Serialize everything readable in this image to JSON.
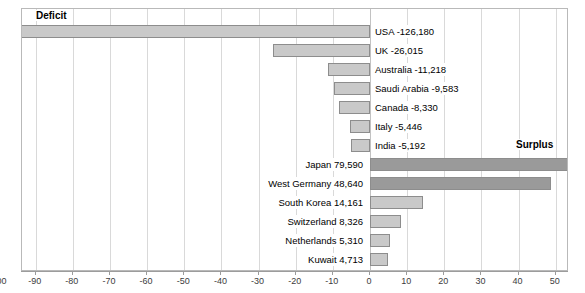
{
  "chart_data": {
    "type": "bar",
    "orientation": "horizontal",
    "title": "",
    "xlabel": "",
    "ylabel": "",
    "xlim": [
      -135,
      78
    ],
    "grid": true,
    "grid_step": 10,
    "unit_note": "values in millions",
    "annotations": [
      {
        "text": "Deficit",
        "position": "top-left"
      },
      {
        "text": "Surplus",
        "position": "middle-right"
      }
    ],
    "xticks": [
      -130,
      -120,
      -110,
      -100,
      -90,
      -80,
      -70,
      -60,
      -50,
      -40,
      -30,
      -20,
      -10,
      0,
      10,
      20,
      30,
      40,
      50,
      60,
      70
    ],
    "xtick_labels": [
      "-130",
      "-120",
      "-110",
      "-100",
      "-90",
      "-80",
      "-70",
      "-60",
      "-50",
      "-40",
      "-30",
      "-20",
      "-10",
      "0",
      "10",
      "20",
      "30",
      "40",
      "50",
      "60",
      "70"
    ],
    "categories": [
      "USA",
      "UK",
      "Australia",
      "Saudi Arabia",
      "Canada",
      "Italy",
      "India",
      "Japan",
      "West Germany",
      "South Korea",
      "Switzerland",
      "Netherlands",
      "Kuwait"
    ],
    "values": [
      -126.18,
      -26.015,
      -11.218,
      -9.583,
      -8.33,
      -5.446,
      -5.192,
      79.59,
      48.64,
      14.161,
      8.326,
      5.31,
      4.713
    ],
    "bars": [
      {
        "label": "USA -126,180",
        "name": "USA",
        "value": -126.18,
        "side": "deficit",
        "shade": "light"
      },
      {
        "label": "UK -26,015",
        "name": "UK",
        "value": -26.015,
        "side": "deficit",
        "shade": "light"
      },
      {
        "label": "Australia -11,218",
        "name": "Australia",
        "value": -11.218,
        "side": "deficit",
        "shade": "light"
      },
      {
        "label": "Saudi Arabia -9,583",
        "name": "Saudi Arabia",
        "value": -9.583,
        "side": "deficit",
        "shade": "light"
      },
      {
        "label": "Canada -8,330",
        "name": "Canada",
        "value": -8.33,
        "side": "deficit",
        "shade": "light"
      },
      {
        "label": "Italy -5,446",
        "name": "Italy",
        "value": -5.446,
        "side": "deficit",
        "shade": "light"
      },
      {
        "label": "India -5,192",
        "name": "India",
        "value": -5.192,
        "side": "deficit",
        "shade": "light"
      },
      {
        "label": "Japan 79,590",
        "name": "Japan",
        "value": 79.59,
        "side": "surplus",
        "shade": "dark"
      },
      {
        "label": "West Germany 48,640",
        "name": "West Germany",
        "value": 48.64,
        "side": "surplus",
        "shade": "dark"
      },
      {
        "label": "South Korea 14,161",
        "name": "South Korea",
        "value": 14.161,
        "side": "surplus",
        "shade": "light"
      },
      {
        "label": "Switzerland 8,326",
        "name": "Switzerland",
        "value": 8.326,
        "side": "surplus",
        "shade": "light"
      },
      {
        "label": "Netherlands 5,310",
        "name": "Netherlands",
        "value": 5.31,
        "side": "surplus",
        "shade": "light"
      },
      {
        "label": "Kuwait 4,713",
        "name": "Kuwait",
        "value": 4.713,
        "side": "surplus",
        "shade": "light"
      }
    ]
  },
  "labels": {
    "deficit": "Deficit",
    "surplus": "Surplus"
  },
  "colors": {
    "bar_light_fill": "#c9c9c9",
    "bar_dark_fill": "#9a9a9a",
    "bar_border": "#8d8d8d",
    "gridline": "#d9d9d9",
    "frame": "#b9b9b9",
    "axis": "#9c9c9c",
    "text": "#000000",
    "tick_text": "#3c3c3c"
  }
}
